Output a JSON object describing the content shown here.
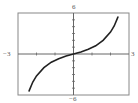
{
  "chart_data": {
    "type": "line",
    "title": "",
    "xlabel": "",
    "ylabel": "",
    "xlim": [
      -3,
      3
    ],
    "ylim": [
      -6,
      6
    ],
    "grid": false,
    "legend": null,
    "x_tick_labels": [
      "-3",
      "3"
    ],
    "y_tick_labels": [
      "6",
      "-6"
    ],
    "x_ticks_step": 1,
    "y_ticks_step": 1,
    "series": [
      {
        "name": "f(x)",
        "x": [
          -2.4,
          -2.2,
          -2.0,
          -1.6,
          -1.2,
          -0.8,
          -0.4,
          0,
          0.4,
          0.8,
          1.2,
          1.6,
          2.0,
          2.2,
          2.4
        ],
        "y": [
          -5.4,
          -4.1,
          -3.2,
          -2.0,
          -1.2,
          -0.7,
          -0.3,
          0,
          0.3,
          0.7,
          1.2,
          2.0,
          3.2,
          4.1,
          5.4
        ]
      }
    ]
  },
  "labels": {
    "xmin": "−3",
    "xmax": "3",
    "ymax": "6",
    "ymin": "−6"
  },
  "colors": {
    "frame": "#888888",
    "axis": "#666666",
    "curve": "#222222",
    "label": "#555555"
  }
}
